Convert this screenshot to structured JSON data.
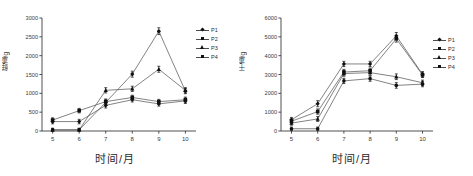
{
  "figure": {
    "panels": [
      {
        "id": "left",
        "ylabel": "鲜重/g",
        "xlabel": "时间/月",
        "legend": [
          "P1",
          "P2",
          "P3",
          "P4"
        ]
      },
      {
        "id": "right",
        "ylabel": "干重/g",
        "xlabel": "时间/月",
        "legend": [
          "P1",
          "P2",
          "P3",
          "P4"
        ]
      }
    ]
  },
  "chart_data": [
    {
      "type": "line",
      "title": "",
      "xlabel": "时间/月",
      "ylabel": "鲜重/g",
      "x": [
        5,
        6,
        7,
        8,
        9,
        10
      ],
      "xticklabels": [
        "5",
        "6",
        "7",
        "8",
        "9",
        "10"
      ],
      "yticks": [
        0,
        500,
        1000,
        1500,
        2000,
        2500,
        3000
      ],
      "yticklabels": [
        "0",
        "500",
        "1000",
        "1500",
        "2000",
        "2500",
        "3000"
      ],
      "ylim": [
        0,
        3000
      ],
      "xlim": [
        4.6,
        10.4
      ],
      "grid": false,
      "legend_position": "right",
      "errorbars": true,
      "series": [
        {
          "name": "P1",
          "marker": "diamond",
          "values": [
            250,
            250,
            680,
            830,
            720,
            800
          ],
          "err": [
            60,
            60,
            70,
            60,
            60,
            70
          ]
        },
        {
          "name": "P2",
          "marker": "square",
          "values": [
            290,
            540,
            780,
            890,
            780,
            830
          ],
          "err": [
            60,
            60,
            70,
            60,
            60,
            70
          ]
        },
        {
          "name": "P3",
          "marker": "triangle",
          "values": [
            30,
            30,
            1080,
            1120,
            1640,
            1080
          ],
          "err": [
            40,
            40,
            70,
            70,
            80,
            70
          ]
        },
        {
          "name": "P4",
          "marker": "circle",
          "values": [
            30,
            30,
            760,
            1510,
            2650,
            1060
          ],
          "err": [
            40,
            40,
            70,
            80,
            90,
            70
          ]
        }
      ]
    },
    {
      "type": "line",
      "title": "",
      "xlabel": "时间/月",
      "ylabel": "干重/g",
      "x": [
        5,
        6,
        7,
        8,
        9,
        10
      ],
      "xticklabels": [
        "5",
        "6",
        "7",
        "8",
        "9",
        "10"
      ],
      "yticks": [
        0,
        1000,
        2000,
        3000,
        4000,
        5000,
        6000
      ],
      "yticklabels": [
        "0",
        "1000",
        "2000",
        "3000",
        "4000",
        "5000",
        "6000"
      ],
      "ylim": [
        0,
        6000
      ],
      "xlim": [
        4.6,
        10.4
      ],
      "grid": false,
      "legend_position": "right",
      "errorbars": true,
      "series": [
        {
          "name": "P1",
          "marker": "diamond",
          "values": [
            600,
            1450,
            3560,
            3560,
            5050,
            3010
          ],
          "err": [
            120,
            160,
            140,
            140,
            180,
            140
          ]
        },
        {
          "name": "P2",
          "marker": "square",
          "values": [
            520,
            1030,
            3130,
            3200,
            4900,
            2980
          ],
          "err": [
            120,
            140,
            140,
            140,
            180,
            140
          ]
        },
        {
          "name": "P3",
          "marker": "triangle",
          "values": [
            420,
            640,
            3050,
            3100,
            2880,
            2560
          ],
          "err": [
            110,
            130,
            140,
            140,
            150,
            140
          ]
        },
        {
          "name": "P4",
          "marker": "circle",
          "values": [
            120,
            120,
            2660,
            2780,
            2420,
            2490
          ],
          "err": [
            90,
            90,
            140,
            140,
            150,
            140
          ]
        }
      ]
    }
  ]
}
